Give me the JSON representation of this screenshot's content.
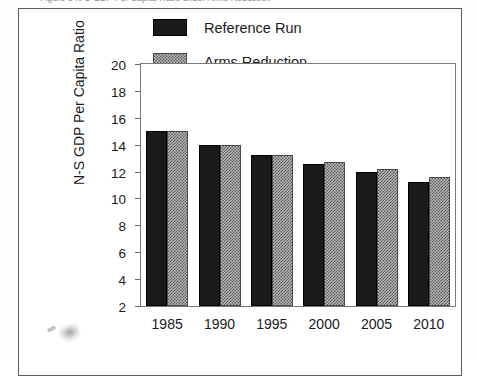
{
  "caption": {
    "text": "Figure 6   N-S GDP Per Capita Ratio under Arms Reduction"
  },
  "chart_data": {
    "type": "bar",
    "title": "",
    "xlabel": "",
    "ylabel": "N-S GDP Per Capita Ratio",
    "categories": [
      "1985",
      "1990",
      "1995",
      "2000",
      "2005",
      "2010"
    ],
    "series": [
      {
        "name": "Reference Run",
        "values": [
          15.0,
          14.0,
          13.2,
          12.6,
          12.0,
          11.2
        ]
      },
      {
        "name": "Arms Reduction",
        "values": [
          15.0,
          14.0,
          13.2,
          12.7,
          12.2,
          11.6
        ]
      }
    ],
    "ylim": [
      2,
      20
    ],
    "yticks": [
      "20",
      "18",
      "16",
      "14",
      "12",
      "10",
      "8",
      "6",
      "4",
      "2"
    ],
    "grid": false,
    "legend_position": "top-center",
    "colors": {
      "reference_run": "#1a1a1a",
      "arms_reduction": "#b4b4b4",
      "axis": "#7a7a7a",
      "text": "#1b1b1b",
      "frame": "#5d5d5d",
      "background": "#ffffff"
    }
  }
}
